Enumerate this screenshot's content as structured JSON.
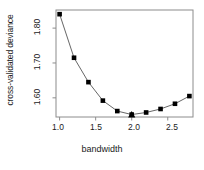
{
  "chart_data": {
    "type": "line",
    "title": "",
    "subtitle": "",
    "xlabel": "bandwidth",
    "ylabel": "cross-validated deviance",
    "x": [
      1.0,
      1.2,
      1.4,
      1.6,
      1.8,
      2.0,
      2.2,
      2.4,
      2.6,
      2.8
    ],
    "values": [
      1.84,
      1.715,
      1.645,
      1.592,
      1.562,
      1.552,
      1.558,
      1.568,
      1.583,
      1.605
    ],
    "series": [
      {
        "name": "cross-validated deviance",
        "values": [
          1.84,
          1.715,
          1.645,
          1.592,
          1.562,
          1.552,
          1.558,
          1.568,
          1.583,
          1.605
        ]
      }
    ],
    "xlim": [
      0.95,
      2.85
    ],
    "ylim": [
      1.545,
      1.852
    ],
    "xticks": [
      1.0,
      1.5,
      2.0,
      2.5
    ],
    "xticklabels": [
      "1.0",
      "1.5",
      "2.0",
      "2.5"
    ],
    "yticks": [
      1.6,
      1.7,
      1.8
    ],
    "yticklabels": [
      "1.60",
      "1.70",
      "1.80"
    ],
    "grid": false,
    "legend": null,
    "marker": "filled-square",
    "line_color": "#555555",
    "marker_color": "#000000",
    "frame_color": "#8c8c8c",
    "minimum_marker": {
      "shape": "filled-triangle",
      "x": 2.0,
      "y": 1.552,
      "color": "#000000",
      "label": ""
    },
    "annotations": []
  },
  "axes": {
    "ylabel_text": "cross-validated deviance",
    "xlabel_text": "bandwidth",
    "ytick_texts": [
      "1.80",
      "1.70",
      "1.60"
    ],
    "xtick_texts": [
      "1.0",
      "1.5",
      "2.0",
      "2.5"
    ]
  }
}
